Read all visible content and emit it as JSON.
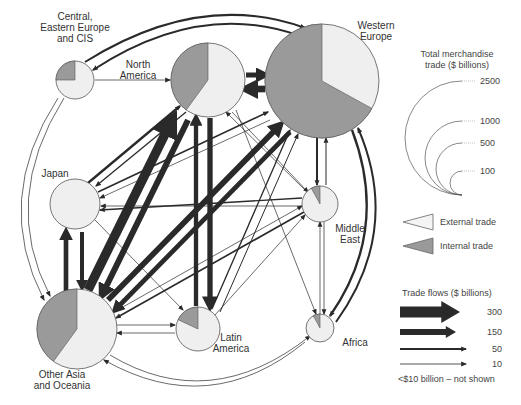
{
  "colors": {
    "external": "#efefef",
    "internal": "#9a9a9a",
    "stroke": "#555555",
    "flow": "#2a2a2a",
    "background": "#ffffff"
  },
  "regions": [
    {
      "id": "cee",
      "label_lines": [
        "Central,",
        "Eastern Europe",
        "and CIS"
      ],
      "cx": 75,
      "cy": 80,
      "r": 19,
      "internal_share": 0.25,
      "label_x": 75,
      "label_y": 20,
      "anchor": "middle"
    },
    {
      "id": "na",
      "label_lines": [
        "North",
        "America"
      ],
      "cx": 208,
      "cy": 80,
      "r": 37,
      "internal_share": 0.4,
      "label_x": 138,
      "label_y": 68,
      "anchor": "middle"
    },
    {
      "id": "we",
      "label_lines": [
        "Western",
        "Europe"
      ],
      "cx": 322,
      "cy": 81,
      "r": 57,
      "internal_share": 0.67,
      "label_x": 376,
      "label_y": 29,
      "anchor": "middle"
    },
    {
      "id": "jp",
      "label_lines": [
        "Japan"
      ],
      "cx": 75,
      "cy": 204,
      "r": 25,
      "internal_share": 0.0,
      "label_x": 55,
      "label_y": 177,
      "anchor": "middle"
    },
    {
      "id": "me",
      "label_lines": [
        "Middle",
        "East"
      ],
      "cx": 320,
      "cy": 204,
      "r": 18,
      "internal_share": 0.08,
      "label_x": 350,
      "label_y": 232,
      "anchor": "middle"
    },
    {
      "id": "oa",
      "label_lines": [
        "Other Asia",
        "and Oceania"
      ],
      "cx": 77,
      "cy": 329,
      "r": 40,
      "internal_share": 0.4,
      "label_x": 62,
      "label_y": 378,
      "anchor": "middle"
    },
    {
      "id": "la",
      "label_lines": [
        "Latin",
        "America"
      ],
      "cx": 198,
      "cy": 329,
      "r": 22,
      "internal_share": 0.18,
      "label_x": 231,
      "label_y": 341,
      "anchor": "middle"
    },
    {
      "id": "af",
      "label_lines": [
        "Africa"
      ],
      "cx": 320,
      "cy": 328,
      "r": 14,
      "internal_share": 0.08,
      "label_x": 355,
      "label_y": 346,
      "anchor": "middle"
    }
  ],
  "flows": [
    {
      "from": "na",
      "to": "we",
      "value": 150,
      "path": "M 246 75 L 265 75"
    },
    {
      "from": "we",
      "to": "na",
      "value": 200,
      "path": "M 265 89 L 246 89"
    },
    {
      "from": "cee",
      "to": "we",
      "value": 60,
      "path": "M 85 62 Q 200 -10 305 28"
    },
    {
      "from": "we",
      "to": "cee",
      "value": 60,
      "path": "M 300 36 Q 200 0 93 70"
    },
    {
      "from": "cee",
      "to": "na",
      "value": 10,
      "path": "M 95 80 L 170 80"
    },
    {
      "from": "jp",
      "to": "na",
      "value": 70,
      "path": "M 88 183 L 180 106"
    },
    {
      "from": "na",
      "to": "jp",
      "value": 40,
      "path": "M 186 112 L 96 186"
    },
    {
      "from": "jp",
      "to": "we",
      "value": 50,
      "path": "M 98 192 L 268 112"
    },
    {
      "from": "we",
      "to": "jp",
      "value": 20,
      "path": "M 270 120 L 100 198"
    },
    {
      "from": "we",
      "to": "jp",
      "value": 10,
      "path": "M 302 206 L 101 206"
    },
    {
      "from": "jp",
      "to": "oa",
      "value": 140,
      "path": "M 66 304 L 66 232"
    },
    {
      "from": "oa",
      "to": "jp",
      "value": 120,
      "path": "M 82 232 L 82 287"
    },
    {
      "from": "oa",
      "to": "na",
      "value": 280,
      "path": "M 88 290 L 172 120"
    },
    {
      "from": "na",
      "to": "oa",
      "value": 180,
      "path": "M 188 120 L 102 295"
    },
    {
      "from": "oa",
      "to": "we",
      "value": 170,
      "path": "M 108 300 L 280 125"
    },
    {
      "from": "we",
      "to": "oa",
      "value": 140,
      "path": "M 290 132 L 115 310"
    },
    {
      "from": "na",
      "to": "la",
      "value": 160,
      "path": "M 210 118 L 210 306"
    },
    {
      "from": "la",
      "to": "na",
      "value": 130,
      "path": "M 196 306 L 196 118"
    },
    {
      "from": "la",
      "to": "we",
      "value": 40,
      "path": "M 212 309 L 290 130"
    },
    {
      "from": "we",
      "to": "la",
      "value": 30,
      "path": "M 220 312 L 298 134"
    },
    {
      "from": "oa",
      "to": "la",
      "value": 20,
      "path": "M 117 325 L 175 325"
    },
    {
      "from": "la",
      "to": "oa",
      "value": 15,
      "path": "M 175 333 L 117 333"
    },
    {
      "from": "we",
      "to": "me",
      "value": 60,
      "path": "M 317 138 L 317 185"
    },
    {
      "from": "me",
      "to": "we",
      "value": 30,
      "path": "M 326 185 L 326 138"
    },
    {
      "from": "me",
      "to": "jp",
      "value": 40,
      "path": "M 302 198 L 100 210"
    },
    {
      "from": "me",
      "to": "na",
      "value": 20,
      "path": "M 305 190 L 226 112"
    },
    {
      "from": "na",
      "to": "me",
      "value": 15,
      "path": "M 232 112 L 308 192"
    },
    {
      "from": "me",
      "to": "oa",
      "value": 50,
      "path": "M 304 212 L 116 318"
    },
    {
      "from": "oa",
      "to": "me",
      "value": 20,
      "path": "M 114 312 L 302 206"
    },
    {
      "from": "na",
      "to": "af",
      "value": 15,
      "path": "M 236 110 L 316 314"
    },
    {
      "from": "we",
      "to": "af",
      "value": 70,
      "path": "M 352 130 Q 390 230 330 316"
    },
    {
      "from": "af",
      "to": "we",
      "value": 60,
      "path": "M 336 322 Q 402 230 358 128"
    },
    {
      "from": "af",
      "to": "la",
      "value": 10,
      "path": "M 320 314 L 320 222"
    },
    {
      "from": "oa",
      "to": "af",
      "value": 20,
      "path": "M 110 355 Q 210 415 310 336"
    },
    {
      "from": "af",
      "to": "oa",
      "value": 15,
      "path": "M 305 342 Q 210 420 104 360"
    },
    {
      "from": "cee",
      "to": "oa",
      "value": 15,
      "path": "M 64 98 Q 0 200 50 296"
    },
    {
      "from": "oa",
      "to": "cee",
      "value": 10,
      "path": "M 58 98 Q -8 200 44 300"
    },
    {
      "from": "jp",
      "to": "la",
      "value": 10,
      "path": "M 95 220 L 183 310"
    },
    {
      "from": "la",
      "to": "me",
      "value": 10,
      "path": "M 215 315 L 305 215"
    },
    {
      "from": "me",
      "to": "af",
      "value": 10,
      "path": "M 324 222 L 324 314"
    }
  ],
  "outer_ring": {
    "cx": 215,
    "cy": 205,
    "rx": 200,
    "ry": 195
  },
  "legend": {
    "total_trade": {
      "title_lines": [
        "Total merchandise",
        "trade ($ billions)"
      ],
      "items": [
        {
          "value": "2500",
          "r": 57
        },
        {
          "value": "1000",
          "r": 37
        },
        {
          "value": "500",
          "r": 26
        },
        {
          "value": "100",
          "r": 12
        }
      ]
    },
    "trade_type": [
      {
        "label": "External trade",
        "kind": "external"
      },
      {
        "label": "Internal trade",
        "kind": "internal"
      }
    ],
    "trade_flows": {
      "title": "Trade flows ($ billions)",
      "items": [
        {
          "value": "300",
          "width": 11
        },
        {
          "value": "150",
          "width": 6
        },
        {
          "value": "50",
          "width": 2
        },
        {
          "value": "10",
          "width": 0.8
        }
      ],
      "note": "<$10 billion – not shown"
    }
  }
}
